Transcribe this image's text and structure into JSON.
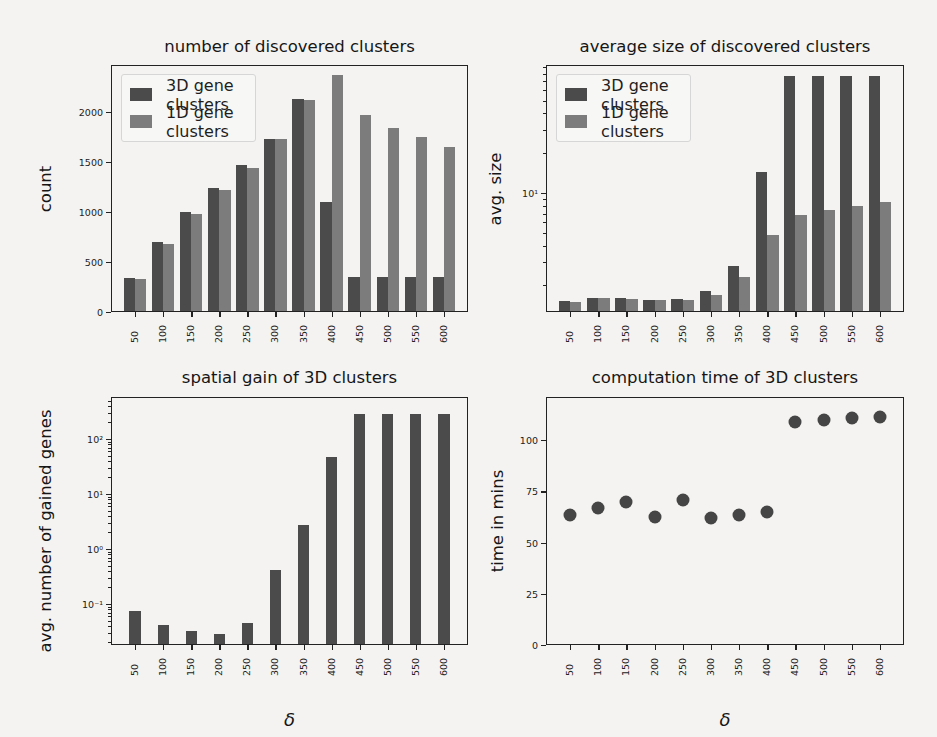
{
  "figure": {
    "colors": {
      "series_3d": "#4b4b4b",
      "series_1d": "#7c7c7c",
      "background": "#f4f3f1",
      "scatter": "#454545"
    },
    "legend": {
      "items": [
        {
          "label": "3D gene clusters",
          "color": "#4b4b4b"
        },
        {
          "label": "1D gene clusters",
          "color": "#7c7c7c"
        }
      ]
    }
  },
  "chart_data": [
    {
      "id": "count",
      "type": "bar",
      "title": "number of discovered clusters",
      "xlabel": "",
      "ylabel": "count",
      "ylim": [
        0,
        2470
      ],
      "yscale": "linear",
      "yticks": [
        0,
        500,
        1000,
        1500,
        2000
      ],
      "ytick_labels": [
        "0",
        "500",
        "1000",
        "1500",
        "2000"
      ],
      "categories": [
        "50",
        "100",
        "150",
        "200",
        "250",
        "300",
        "350",
        "400",
        "450",
        "500",
        "550",
        "600"
      ],
      "series": [
        {
          "name": "3D gene clusters",
          "values": [
            337,
            703,
            1003,
            1243,
            1467,
            1730,
            2130,
            1103,
            353,
            353,
            353,
            353
          ]
        },
        {
          "name": "1D gene clusters",
          "values": [
            327,
            680,
            980,
            1220,
            1443,
            1730,
            2120,
            2370,
            1970,
            1843,
            1753,
            1653
          ]
        }
      ],
      "legend_position": "upper left",
      "grid": false
    },
    {
      "id": "avgsize",
      "type": "bar",
      "title": "average size of discovered clusters",
      "xlabel": "",
      "ylabel": "avg. size",
      "yscale": "log",
      "ylim": [
        1.26,
        93
      ],
      "yticks": [
        10
      ],
      "ytick_labels": [
        "10¹"
      ],
      "categories": [
        "50",
        "100",
        "150",
        "200",
        "250",
        "300",
        "350",
        "400",
        "450",
        "500",
        "550",
        "600"
      ],
      "series": [
        {
          "name": "3D gene clusters",
          "values": [
            1.53,
            1.61,
            1.6,
            1.56,
            1.57,
            1.81,
            2.81,
            14.4,
            77,
            77,
            77,
            77
          ]
        },
        {
          "name": "1D gene clusters",
          "values": [
            1.49,
            1.6,
            1.59,
            1.54,
            1.55,
            1.69,
            2.32,
            4.83,
            6.8,
            7.4,
            8.0,
            8.6
          ]
        }
      ],
      "legend_position": "upper left",
      "grid": false
    },
    {
      "id": "gain",
      "type": "bar",
      "title": "spatial gain of 3D clusters",
      "xlabel": "δ",
      "ylabel": "avg. number of gained genes",
      "yscale": "log",
      "ylim": [
        0.018,
        580
      ],
      "yticks": [
        0.1,
        1,
        10,
        100
      ],
      "ytick_labels": [
        "10⁻¹",
        "10⁰",
        "10¹",
        "10²"
      ],
      "categories": [
        "50",
        "100",
        "150",
        "200",
        "250",
        "300",
        "350",
        "400",
        "450",
        "500",
        "550",
        "600"
      ],
      "series": [
        {
          "name": "3D gene clusters",
          "values": [
            0.075,
            0.042,
            0.033,
            0.028,
            0.046,
            0.41,
            2.7,
            48,
            280,
            280,
            280,
            280
          ]
        }
      ],
      "grid": false
    },
    {
      "id": "time",
      "type": "scatter",
      "title": "computation time of 3D clusters",
      "xlabel": "δ",
      "ylabel": "time in mins",
      "yscale": "linear",
      "ylim": [
        0,
        121
      ],
      "yticks": [
        0,
        25,
        50,
        75,
        100
      ],
      "ytick_labels": [
        "0",
        "25",
        "50",
        "75",
        "100"
      ],
      "categories": [
        "50",
        "100",
        "150",
        "200",
        "250",
        "300",
        "350",
        "400",
        "450",
        "500",
        "550",
        "600"
      ],
      "series": [
        {
          "name": "3D gene clusters",
          "values": [
            63.2,
            66.7,
            69.8,
            62.3,
            70.9,
            61.8,
            63.4,
            64.9,
            108.7,
            109.8,
            110.9,
            111.3
          ]
        }
      ],
      "grid": false
    }
  ]
}
